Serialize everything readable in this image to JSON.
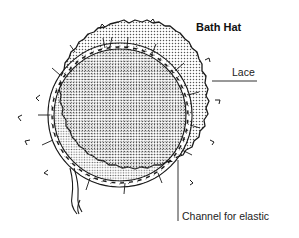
{
  "diagram": {
    "title": "Bath Hat",
    "labels": {
      "lace": "Lace",
      "channel": "Channel for elastic"
    },
    "colors": {
      "line": "#1a1a1a",
      "dots": "#555555",
      "background": "#ffffff"
    }
  }
}
